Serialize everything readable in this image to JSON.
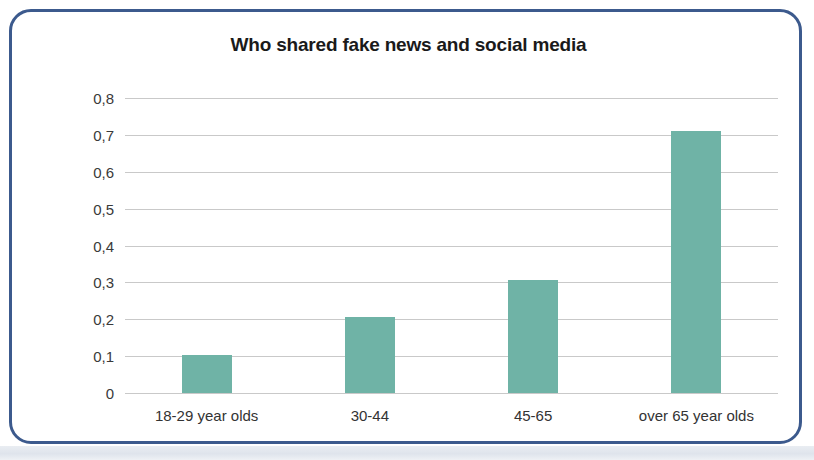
{
  "figure": {
    "border_color": "#3c5a8d",
    "background": "#ffffff"
  },
  "chart_data": {
    "type": "bar",
    "title": "Who shared fake news and social media",
    "xlabel": "",
    "ylabel": "",
    "categories": [
      "18-29 year olds",
      "30-44",
      "45-65",
      "over 65 year olds"
    ],
    "values": [
      0.102,
      0.205,
      0.307,
      0.71
    ],
    "ylim": [
      0,
      0.8
    ],
    "ytick_values": [
      0.8,
      0.7,
      0.6,
      0.5,
      0.4,
      0.3,
      0.2,
      0.1,
      0
    ],
    "ytick_labels": [
      "0,8",
      "0,7",
      "0,6",
      "0,5",
      "0,4",
      "0,3",
      "0,2",
      "0,1",
      "0"
    ],
    "decimal_separator": ",",
    "grid": true,
    "gridline_color": "#c9c9c9",
    "legend": null,
    "bar_color": "#6fb3a6",
    "bar_width_px": 50
  }
}
